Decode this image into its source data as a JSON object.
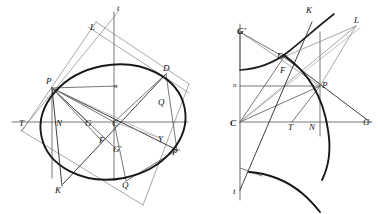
{
  "plate": {
    "title": "Conic sections plate: ellipse with conjugate diameters and hyperbola with asymptotes",
    "background_color": "#ffffff",
    "ink_color": "#181818",
    "width": 378,
    "height": 214
  },
  "figures": [
    {
      "id": "figure-left",
      "name": "ellipse-figure",
      "curve_type": "ellipse",
      "description": "Ellipse inscribed in a parallelogram with conjugate diameters, tangent and normal at P",
      "labels": [
        {
          "key": "t",
          "text": "t",
          "x": 117,
          "y": 11,
          "style": "italic"
        },
        {
          "key": "L",
          "text": "L",
          "x": 90,
          "y": 30,
          "style": "italic"
        },
        {
          "key": "D",
          "text": "D",
          "x": 163,
          "y": 71,
          "style": "italic"
        },
        {
          "key": "P",
          "text": "P",
          "x": 46,
          "y": 84,
          "style": "italic"
        },
        {
          "key": "n",
          "text": "n",
          "x": 114,
          "y": 88,
          "style": "italic-small"
        },
        {
          "key": "Q2",
          "text": "Q",
          "x": 158,
          "y": 105,
          "style": "italic"
        },
        {
          "key": "T",
          "text": "T",
          "x": 19,
          "y": 126,
          "style": "italic"
        },
        {
          "key": "N",
          "text": "N",
          "x": 56,
          "y": 126,
          "style": "italic"
        },
        {
          "key": "G",
          "text": "G",
          "x": 85,
          "y": 126,
          "style": "italic"
        },
        {
          "key": "C",
          "text": "C",
          "x": 112,
          "y": 126,
          "style": "italic"
        },
        {
          "key": "Y",
          "text": "Y",
          "x": 158,
          "y": 142,
          "style": "italic"
        },
        {
          "key": "F",
          "text": "F",
          "x": 99,
          "y": 143,
          "style": "italic"
        },
        {
          "key": "Gp",
          "text": "G'",
          "x": 113,
          "y": 152,
          "style": "italic"
        },
        {
          "key": "Pp",
          "text": "P'",
          "x": 172,
          "y": 155,
          "style": "italic"
        },
        {
          "key": "K",
          "text": "K",
          "x": 55,
          "y": 193,
          "style": "italic"
        },
        {
          "key": "Q1",
          "text": "Q",
          "x": 122,
          "y": 188,
          "style": "italic"
        }
      ]
    },
    {
      "id": "figure-right",
      "name": "hyperbola-figure",
      "curve_type": "hyperbola",
      "description": "Hyperbola with asymptotes, tangent and normal at P, conjugate diameter CD",
      "labels": [
        {
          "key": "K",
          "text": "K",
          "x": 306,
          "y": 13,
          "style": "italic"
        },
        {
          "key": "L",
          "text": "L",
          "x": 354,
          "y": 23,
          "style": "italic"
        },
        {
          "key": "Gp",
          "text": "G'",
          "x": 239,
          "y": 34,
          "style": "italic-bold"
        },
        {
          "key": "D",
          "text": "D",
          "x": 277,
          "y": 59,
          "style": "italic"
        },
        {
          "key": "F",
          "text": "F",
          "x": 280,
          "y": 73,
          "style": "italic"
        },
        {
          "key": "n",
          "text": "n",
          "x": 233,
          "y": 87,
          "style": "italic-small"
        },
        {
          "key": "P",
          "text": "P",
          "x": 322,
          "y": 88,
          "style": "italic"
        },
        {
          "key": "C",
          "text": "C",
          "x": 232,
          "y": 126,
          "style": "italic-bold"
        },
        {
          "key": "T",
          "text": "T",
          "x": 288,
          "y": 130,
          "style": "italic"
        },
        {
          "key": "N",
          "text": "N",
          "x": 309,
          "y": 130,
          "style": "italic"
        },
        {
          "key": "G",
          "text": "G",
          "x": 363,
          "y": 125,
          "style": "italic"
        },
        {
          "key": "t",
          "text": "t",
          "x": 233,
          "y": 194,
          "style": "italic"
        }
      ]
    }
  ]
}
